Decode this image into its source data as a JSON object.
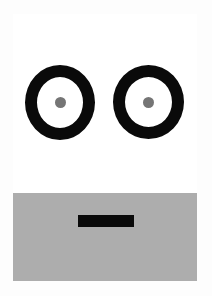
{
  "artwork": {
    "title": "Abstract Face Graphic",
    "description": "A minimal stylized face composed of two black ring eyes with gray pupils above a black rectangular mouth on a gray lower panel.",
    "canvas": {
      "width": 212,
      "height": 296,
      "page_background": "#fdfdfd"
    },
    "card": {
      "name": "face-card",
      "left": 13,
      "top": 14,
      "width": 184,
      "height": 267,
      "background": "#ffffff"
    },
    "panels": [
      {
        "name": "upper-band",
        "label": "Upper white panel",
        "color": "#ffffff",
        "top": 14,
        "height": 179
      },
      {
        "name": "lower-band",
        "label": "Lower gray panel",
        "color": "#adadad",
        "top": 193,
        "height": 88
      }
    ],
    "features": {
      "eyes": [
        {
          "name": "eye-left",
          "label": "Left eye",
          "ring_color": "#0a0a0a",
          "fill_color": "#ffffff",
          "pupil_color": "#757575",
          "center_x": 60,
          "center_y": 102,
          "outer_width": 70,
          "outer_height": 75,
          "ring_thickness": 12,
          "pupil_diameter": 11
        },
        {
          "name": "eye-right",
          "label": "Right eye",
          "ring_color": "#0a0a0a",
          "fill_color": "#ffffff",
          "pupil_color": "#757575",
          "center_x": 148,
          "center_y": 102,
          "outer_width": 71,
          "outer_height": 74,
          "ring_thickness": 12,
          "pupil_diameter": 11
        }
      ],
      "mouth": {
        "name": "mouth",
        "label": "Mouth bar",
        "color": "#0a0a0a",
        "left": 78,
        "top": 215,
        "width": 56,
        "height": 12
      }
    },
    "palette": {
      "black": "#0a0a0a",
      "gray_panel": "#adadad",
      "gray_pupil": "#757575",
      "white": "#ffffff",
      "page": "#fdfdfd"
    }
  }
}
